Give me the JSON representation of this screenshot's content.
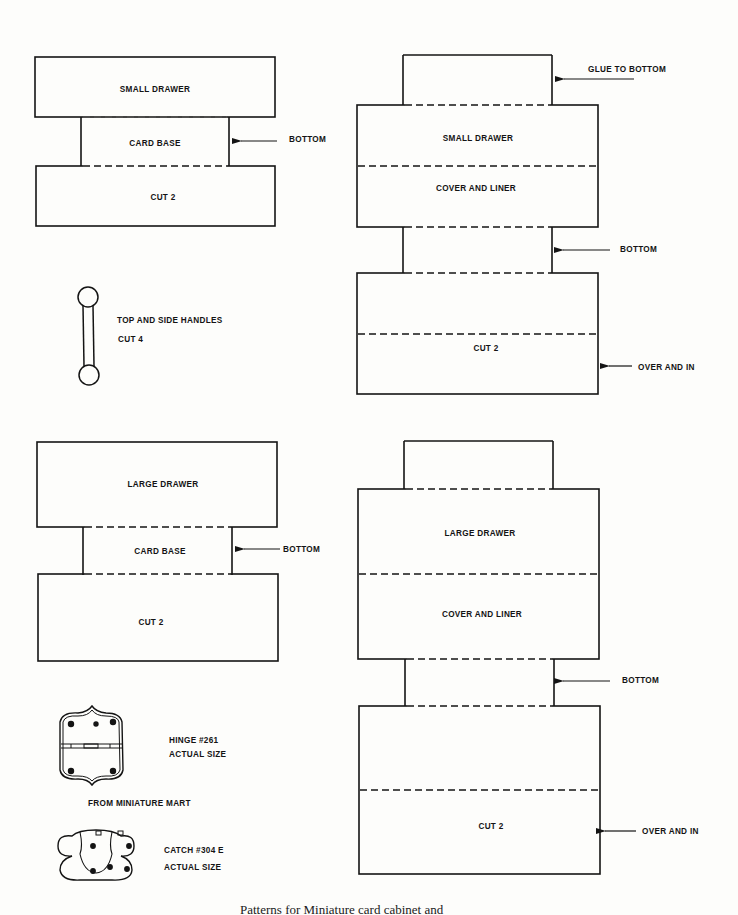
{
  "page": {
    "caption": "Patterns for Miniature card cabinet and"
  },
  "small_card_base": {
    "top_label": "SMALL DRAWER",
    "middle_label": "CARD BASE",
    "bottom_label": "CUT 2",
    "arrow_label": "BOTTOM"
  },
  "handles": {
    "title": "TOP AND SIDE HANDLES",
    "cut": "CUT 4"
  },
  "small_drawer": {
    "glue_label": "GLUE TO BOTTOM",
    "drawer_label": "SMALL DRAWER",
    "cover_label": "COVER AND LINER",
    "bottom_arrow_label": "BOTTOM",
    "cut_label": "CUT 2",
    "over_label": "OVER AND IN"
  },
  "large_card_base": {
    "top_label": "LARGE DRAWER",
    "middle_label": "CARD BASE",
    "bottom_label": "CUT 2",
    "arrow_label": "BOTTOM"
  },
  "large_drawer": {
    "drawer_label": "LARGE DRAWER",
    "cover_label": "COVER AND LINER",
    "bottom_arrow_label": "BOTTOM",
    "cut_label": "CUT 2",
    "over_label": "OVER AND IN"
  },
  "hardware": {
    "hinge_name": "HINGE #261",
    "hinge_size": "ACTUAL SIZE",
    "source": "FROM MINIATURE MART",
    "catch_name": "CATCH #304 E",
    "catch_size": "ACTUAL SIZE"
  }
}
